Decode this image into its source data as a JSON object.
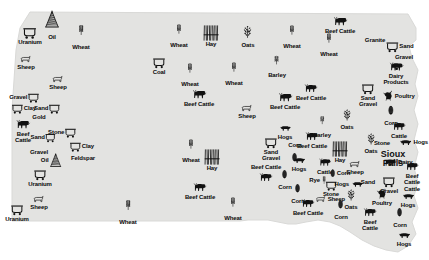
{
  "map": {
    "title": "South Dakota natural resources pictorial map",
    "land_color": "#e3e3e1",
    "outline_color": "#d8d8d6",
    "background_color": "#ffffff",
    "symbol_color": "#111111"
  },
  "cities": [
    {
      "name": "Sioux Falls",
      "line1": "Sioux",
      "line2": "Falls",
      "x": 393,
      "y": 159
    }
  ],
  "legend_symbol_types": {
    "wheat": "wheat-stalk-icon",
    "oats": "oats-stalk-icon",
    "barley": "barley-stalk-icon",
    "rye": "rye-stalk-icon",
    "hay": "hay-bundle-icon",
    "corn": "corn-ear-icon",
    "cattle": "cattle-icon",
    "sheep": "sheep-icon",
    "hogs": "hog-icon",
    "poultry": "poultry-chicken-icon",
    "dairy": "dairy-cow-icon",
    "mine": "mine-cart-icon",
    "oil": "oil-derrick-icon"
  },
  "markers": [
    {
      "id": 1,
      "label": "Oil",
      "type": "oil",
      "x": 52,
      "y": 22,
      "pos": "below",
      "size": 20
    },
    {
      "id": 2,
      "label": "Uranium",
      "type": "mine",
      "x": 30,
      "y": 35,
      "pos": "below",
      "size": 13
    },
    {
      "id": 3,
      "label": "Wheat",
      "type": "wheat",
      "x": 81,
      "y": 33,
      "pos": "below",
      "size": 18
    },
    {
      "id": 4,
      "label": "Sheep",
      "type": "sheep",
      "x": 26,
      "y": 62,
      "pos": "below",
      "size": 13
    },
    {
      "id": 5,
      "label": "Sheep",
      "type": "sheep",
      "x": 58,
      "y": 82,
      "pos": "below",
      "size": 13
    },
    {
      "id": 6,
      "label": "Gravel",
      "type": "mine",
      "x": 24,
      "y": 97,
      "pos": "right",
      "size": 11
    },
    {
      "id": 7,
      "label": "Clay",
      "type": "mine",
      "x": 24,
      "y": 108,
      "pos": "left",
      "size": 11
    },
    {
      "id": 8,
      "label": "Sand",
      "type": "mine",
      "x": 47,
      "y": 108,
      "pos": "right",
      "size": 11
    },
    {
      "id": 9,
      "label": "Gold",
      "type": "none",
      "x": 39,
      "y": 117,
      "pos": "only",
      "size": 0
    },
    {
      "id": 10,
      "label": "Beef\nCattle",
      "type": "cattle",
      "x": 23,
      "y": 130,
      "pos": "below",
      "size": 17
    },
    {
      "id": 11,
      "label": "Sand",
      "type": "mine",
      "x": 43,
      "y": 137,
      "pos": "right",
      "size": 10
    },
    {
      "id": 12,
      "label": "Gravel",
      "type": "none",
      "x": 39,
      "y": 152,
      "pos": "only",
      "size": 0
    },
    {
      "id": 13,
      "label": "Stone",
      "type": "mine",
      "x": 62,
      "y": 132,
      "pos": "right",
      "size": 11
    },
    {
      "id": 14,
      "label": "Clay",
      "type": "mine",
      "x": 82,
      "y": 146,
      "pos": "left",
      "size": 11
    },
    {
      "id": 15,
      "label": "Feldspar",
      "type": "none",
      "x": 83,
      "y": 158,
      "pos": "only",
      "size": 0
    },
    {
      "id": 16,
      "label": "Oil",
      "type": "oil",
      "x": 51,
      "y": 160,
      "pos": "right",
      "size": 16
    },
    {
      "id": 17,
      "label": "Uranium",
      "type": "mine",
      "x": 40,
      "y": 177,
      "pos": "below",
      "size": 12
    },
    {
      "id": 18,
      "label": "Sheep",
      "type": "sheep",
      "x": 39,
      "y": 202,
      "pos": "below",
      "size": 13
    },
    {
      "id": 19,
      "label": "Uranium",
      "type": "mine",
      "x": 17,
      "y": 212,
      "pos": "below",
      "size": 12
    },
    {
      "id": 20,
      "label": "Wheat",
      "type": "wheat",
      "x": 128,
      "y": 208,
      "pos": "below",
      "size": 18
    },
    {
      "id": 21,
      "label": "Wheat",
      "type": "wheat",
      "x": 179,
      "y": 32,
      "pos": "below",
      "size": 17
    },
    {
      "id": 22,
      "label": "Hay",
      "type": "hay",
      "x": 211,
      "y": 36,
      "pos": "below",
      "size": 15
    },
    {
      "id": 23,
      "label": "Oats",
      "type": "oats",
      "x": 248,
      "y": 35,
      "pos": "below",
      "size": 15
    },
    {
      "id": 24,
      "label": "Coal",
      "type": "mine",
      "x": 159,
      "y": 65,
      "pos": "below",
      "size": 12
    },
    {
      "id": 25,
      "label": "Wheat",
      "type": "wheat",
      "x": 190,
      "y": 71,
      "pos": "below",
      "size": 17
    },
    {
      "id": 26,
      "label": "Wheat",
      "type": "wheat",
      "x": 234,
      "y": 70,
      "pos": "below",
      "size": 17
    },
    {
      "id": 27,
      "label": "Barley",
      "type": "barley",
      "x": 277,
      "y": 63,
      "pos": "below",
      "size": 16
    },
    {
      "id": 28,
      "label": "Wheat",
      "type": "wheat",
      "x": 292,
      "y": 33,
      "pos": "below",
      "size": 17
    },
    {
      "id": 29,
      "label": "Wheat",
      "type": "wheat",
      "x": 329,
      "y": 41,
      "pos": "below",
      "size": 17
    },
    {
      "id": 30,
      "label": "Beef Cattle",
      "type": "cattle",
      "x": 340,
      "y": 24,
      "pos": "below",
      "size": 17
    },
    {
      "id": 31,
      "label": "Granite",
      "type": "none",
      "x": 375,
      "y": 40,
      "pos": "only",
      "size": 0
    },
    {
      "id": 32,
      "label": "Sand",
      "type": "mine",
      "x": 400,
      "y": 46,
      "pos": "left",
      "size": 12
    },
    {
      "id": 33,
      "label": "Gravel",
      "type": "none",
      "x": 404,
      "y": 57,
      "pos": "only",
      "size": 0
    },
    {
      "id": 34,
      "label": "Dairy\nProducts",
      "type": "dairy",
      "x": 396,
      "y": 72,
      "pos": "below",
      "size": 16
    },
    {
      "id": 35,
      "label": "Beef Cattle",
      "type": "cattle",
      "x": 199,
      "y": 97,
      "pos": "below",
      "size": 17
    },
    {
      "id": 36,
      "label": "Sheep",
      "type": "sheep",
      "x": 247,
      "y": 111,
      "pos": "below",
      "size": 13
    },
    {
      "id": 37,
      "label": "Beef Cattle",
      "type": "cattle",
      "x": 285,
      "y": 100,
      "pos": "below",
      "size": 17
    },
    {
      "id": 38,
      "label": "Beef Cattle",
      "type": "cattle",
      "x": 311,
      "y": 91,
      "pos": "below",
      "size": 16
    },
    {
      "id": 39,
      "label": "Sand\nGravel",
      "type": "mine",
      "x": 368,
      "y": 94,
      "pos": "below",
      "size": 12
    },
    {
      "id": 40,
      "label": "Poultry",
      "type": "poultry",
      "x": 399,
      "y": 95,
      "pos": "left",
      "size": 13
    },
    {
      "id": 41,
      "label": "Corn",
      "type": "corn",
      "x": 391,
      "y": 113,
      "pos": "below",
      "size": 15
    },
    {
      "id": 42,
      "label": "Cattle",
      "type": "cattle",
      "x": 399,
      "y": 129,
      "pos": "below",
      "size": 16
    },
    {
      "id": 43,
      "label": "Barley",
      "type": "barley",
      "x": 322,
      "y": 123,
      "pos": "below",
      "size": 15
    },
    {
      "id": 44,
      "label": "Oats",
      "type": "oats",
      "x": 347,
      "y": 118,
      "pos": "below",
      "size": 14
    },
    {
      "id": 45,
      "label": "Wheat",
      "type": "wheat",
      "x": 191,
      "y": 147,
      "pos": "below",
      "size": 17
    },
    {
      "id": 46,
      "label": "Hay",
      "type": "hay",
      "x": 212,
      "y": 160,
      "pos": "below",
      "size": 15
    },
    {
      "id": 47,
      "label": "Sand\nGravel",
      "type": "mine",
      "x": 271,
      "y": 148,
      "pos": "below",
      "size": 12
    },
    {
      "id": 48,
      "label": "Beef Cattle",
      "type": "cattle",
      "x": 312,
      "y": 139,
      "pos": "below",
      "size": 16
    },
    {
      "id": 49,
      "label": "Hogs",
      "type": "hogs",
      "x": 413,
      "y": 142,
      "pos": "left",
      "size": 15
    },
    {
      "id": 50,
      "label": "Stone",
      "type": "none",
      "x": 382,
      "y": 143,
      "pos": "only",
      "size": 0
    },
    {
      "id": 51,
      "label": "Oats",
      "type": "oats",
      "x": 371,
      "y": 142,
      "pos": "below",
      "size": 14
    },
    {
      "id": 52,
      "label": "Corn",
      "type": "corn",
      "x": 295,
      "y": 154,
      "pos": "above",
      "size": 14
    },
    {
      "id": 53,
      "label": "Hogs",
      "type": "hogs",
      "x": 299,
      "y": 163,
      "pos": "below",
      "size": 15
    },
    {
      "id": 54,
      "label": "Hay",
      "type": "hay",
      "x": 340,
      "y": 152,
      "pos": "below",
      "size": 15
    },
    {
      "id": 55,
      "label": "Cattle",
      "type": "cattle",
      "x": 325,
      "y": 165,
      "pos": "below",
      "size": 15
    },
    {
      "id": 56,
      "label": "Sheep",
      "type": "sheep",
      "x": 355,
      "y": 167,
      "pos": "below",
      "size": 13
    },
    {
      "id": 57,
      "label": "Corn",
      "type": "corn",
      "x": 340,
      "y": 173,
      "pos": "left",
      "size": 13
    },
    {
      "id": 58,
      "label": "Beef Cattle",
      "type": "cattle",
      "x": 266,
      "y": 174,
      "pos": "above",
      "size": 16
    },
    {
      "id": 59,
      "label": "Dairy",
      "type": "dairy",
      "x": 398,
      "y": 162,
      "pos": "left",
      "size": 14
    },
    {
      "id": 60,
      "label": "Beef\nCattle",
      "type": "cattle",
      "x": 412,
      "y": 172,
      "pos": "below",
      "size": 16
    },
    {
      "id": 61,
      "label": "Rye",
      "type": "rye",
      "x": 318,
      "y": 180,
      "pos": "right",
      "size": 14
    },
    {
      "id": 62,
      "label": "Stone",
      "type": "mine",
      "x": 331,
      "y": 188,
      "pos": "below",
      "size": 11
    },
    {
      "id": 63,
      "label": "Hogs",
      "type": "hogs",
      "x": 349,
      "y": 184,
      "pos": "right",
      "size": 14
    },
    {
      "id": 64,
      "label": "Sand",
      "type": "none",
      "x": 368,
      "y": 182,
      "pos": "only",
      "size": 0
    },
    {
      "id": 65,
      "label": "Gravel",
      "type": "mine",
      "x": 389,
      "y": 184,
      "pos": "below",
      "size": 12
    },
    {
      "id": 66,
      "label": "Cattle",
      "type": "none",
      "x": 412,
      "y": 189,
      "pos": "only",
      "size": 0
    },
    {
      "id": 67,
      "label": "Corn",
      "type": "corn",
      "x": 298,
      "y": 191,
      "pos": "below",
      "size": 14
    },
    {
      "id": 68,
      "label": "Sheep",
      "type": "sheep",
      "x": 330,
      "y": 199,
      "pos": "left",
      "size": 12
    },
    {
      "id": 69,
      "label": "Oats",
      "type": "oats",
      "x": 351,
      "y": 198,
      "pos": "below",
      "size": 14
    },
    {
      "id": 70,
      "label": "Poultry",
      "type": "poultry",
      "x": 382,
      "y": 196,
      "pos": "below",
      "size": 13
    },
    {
      "id": 71,
      "label": "Hogs",
      "type": "hogs",
      "x": 408,
      "y": 199,
      "pos": "below",
      "size": 15
    },
    {
      "id": 72,
      "label": "Beef Cattle",
      "type": "cattle",
      "x": 308,
      "y": 206,
      "pos": "below",
      "size": 16
    },
    {
      "id": 73,
      "label": "Corn",
      "type": "corn",
      "x": 341,
      "y": 207,
      "pos": "below",
      "size": 14
    },
    {
      "id": 74,
      "label": "Corn",
      "type": "corn",
      "x": 400,
      "y": 215,
      "pos": "below",
      "size": 14
    },
    {
      "id": 75,
      "label": "Beef\nCattle",
      "type": "cattle",
      "x": 370,
      "y": 218,
      "pos": "below",
      "size": 16
    },
    {
      "id": 76,
      "label": "Hogs",
      "type": "hogs",
      "x": 404,
      "y": 238,
      "pos": "below",
      "size": 15
    },
    {
      "id": 77,
      "label": "Beef Cattle",
      "type": "cattle",
      "x": 200,
      "y": 190,
      "pos": "below",
      "size": 16
    },
    {
      "id": 78,
      "label": "Wheat",
      "type": "wheat",
      "x": 233,
      "y": 205,
      "pos": "below",
      "size": 17
    },
    {
      "id": 79,
      "label": "Corn",
      "type": "corn",
      "x": 285,
      "y": 177,
      "pos": "below",
      "size": 14
    },
    {
      "id": 80,
      "label": "Hogs",
      "type": "hogs",
      "x": 285,
      "y": 131,
      "pos": "below",
      "size": 14
    }
  ]
}
